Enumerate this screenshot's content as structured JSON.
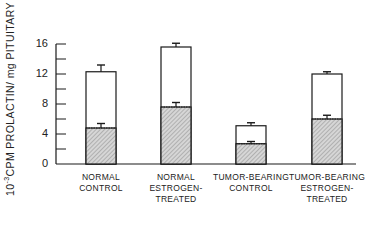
{
  "chart_data": {
    "type": "bar",
    "stacked_overlay": true,
    "title": "",
    "ylabel_prefix": "10",
    "ylabel_exp": "-3",
    "ylabel_rest": "CPM  PROLACTIN/ mg  PITUITARY",
    "ylabel": "10^-3 CPM PROLACTIN/ mg PITUITARY",
    "xlabel": "",
    "ylim": [
      0,
      16
    ],
    "yticks_labeled": [
      0,
      4,
      8,
      12,
      16
    ],
    "yticks_minor": [
      2,
      6,
      10,
      14
    ],
    "grid": false,
    "categories": [
      [
        "NORMAL",
        "CONTROL"
      ],
      [
        "NORMAL",
        "ESTROGEN-",
        "TREATED"
      ],
      [
        "TUMOR-BEARING",
        "CONTROL"
      ],
      [
        "TUMOR-BEARING",
        "ESTROGEN-",
        "TREATED"
      ]
    ],
    "series": [
      {
        "name": "total (open bar)",
        "fill": "#ffffff",
        "values": [
          12.3,
          15.6,
          5.1,
          12.0
        ],
        "error": [
          0.9,
          0.5,
          0.4,
          0.3
        ]
      },
      {
        "name": "hatched portion",
        "fill": "hatched",
        "values": [
          4.8,
          7.6,
          2.7,
          6.0
        ],
        "error": [
          0.6,
          0.6,
          0.3,
          0.5
        ]
      }
    ]
  },
  "style": {
    "line_color": "#1a1a1a",
    "hatch_bg": "#d9d9d9",
    "hatch_line": "#8a8a8a"
  }
}
